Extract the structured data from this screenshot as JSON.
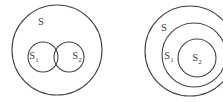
{
  "figure": {
    "type": "set-theory-venn-diagram",
    "width": 223,
    "height": 103,
    "background_color": "#ffffff",
    "stroke_color": "#444444",
    "text_color": "#3b3b3b",
    "panels": [
      {
        "id": "left-panel",
        "name": "overlapping-subsets",
        "description": "Universal set S containing two overlapping subsets S1 and S2",
        "circles": [
          {
            "id": "S",
            "cx": 57,
            "cy": 50,
            "r": 45
          },
          {
            "id": "S1",
            "cx": 43,
            "cy": 57,
            "r": 15
          },
          {
            "id": "S2",
            "cx": 69,
            "cy": 57,
            "r": 15
          }
        ],
        "labels": [
          {
            "id": "S",
            "base": "S",
            "sub": "",
            "x": 41,
            "y": 23
          },
          {
            "id": "S1",
            "base": "S",
            "sub": "1",
            "x": 34,
            "y": 57
          },
          {
            "id": "S2",
            "base": "S",
            "sub": "2",
            "x": 77,
            "y": 57
          }
        ]
      },
      {
        "id": "right-panel",
        "name": "nested-subsets",
        "description": "Universal set S containing S1 which contains S2 (concentric nesting)",
        "circles": [
          {
            "id": "S",
            "cx": 190,
            "cy": 51,
            "r": 45
          },
          {
            "id": "S1",
            "cx": 194,
            "cy": 55,
            "r": 32
          },
          {
            "id": "S2",
            "cx": 197,
            "cy": 58,
            "r": 19
          }
        ],
        "labels": [
          {
            "id": "S",
            "base": "S",
            "sub": "",
            "x": 164,
            "y": 29
          },
          {
            "id": "S1",
            "base": "S",
            "sub": "1",
            "x": 169,
            "y": 57
          },
          {
            "id": "S2",
            "base": "S",
            "sub": "2",
            "x": 197,
            "y": 59
          }
        ]
      }
    ]
  }
}
